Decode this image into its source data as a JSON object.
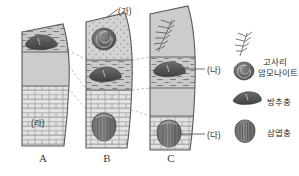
{
  "figure": {
    "kind": "geologic-columns-correlation",
    "background": "#ffffff",
    "ink": "#4a4a4a"
  },
  "columns": [
    {
      "id": "A",
      "letter": "A",
      "layers": [
        {
          "name": "shale-upper",
          "pattern": "shale-dashes",
          "fill": "#c9c9c9"
        },
        {
          "name": "mudstone-middle",
          "pattern": "plain",
          "fill": "#cccccc"
        },
        {
          "name": "limestone-lower",
          "pattern": "brick",
          "fill": "#e2e2e2"
        }
      ],
      "fossils": [
        "fusulinid"
      ],
      "label": "(라)"
    },
    {
      "id": "B",
      "letter": "B",
      "layers": [
        {
          "name": "sandstone-upper",
          "pattern": "dots",
          "fill": "#d2d2d2"
        },
        {
          "name": "shale-middle",
          "pattern": "shale-dashes",
          "fill": "#c9c9c9"
        },
        {
          "name": "limestone-lower",
          "pattern": "brick",
          "fill": "#e2e2e2"
        }
      ],
      "fossils": [
        "ammonite",
        "fusulinid",
        "trilobite"
      ],
      "label": "(가)"
    },
    {
      "id": "C",
      "letter": "C",
      "layers": [
        {
          "name": "mudstone-top",
          "pattern": "plain",
          "fill": "#cccccc"
        },
        {
          "name": "shale-upper",
          "pattern": "shale-dashes",
          "fill": "#c9c9c9"
        },
        {
          "name": "mudstone-middle",
          "pattern": "plain",
          "fill": "#cccccc"
        },
        {
          "name": "limestone-lower",
          "pattern": "brick",
          "fill": "#e2e2e2"
        }
      ],
      "fossils": [
        "fern",
        "fusulinid",
        "trilobite"
      ],
      "labels": [
        "(나)",
        "(다)"
      ]
    }
  ],
  "annotations": {
    "ga": "(가)",
    "na": "(나)",
    "da": "(다)",
    "ra": "(라)"
  },
  "letters": {
    "a": "A",
    "b": "B",
    "c": "C"
  },
  "legend": {
    "items": [
      {
        "icon": "fern-icon",
        "label": "고사리"
      },
      {
        "icon": "ammonite-icon",
        "label": "암모나이트"
      },
      {
        "icon": "fusulinid-icon",
        "label": "방추충"
      },
      {
        "icon": "trilobite-icon",
        "label": "삼엽충"
      }
    ]
  },
  "colors": {
    "outline": "#555555",
    "shale_fill": "#c9c9c9",
    "plain_fill": "#cccccc",
    "brick_fill": "#e3e3e3",
    "dots_fill": "#d3d3d3",
    "fossil_dark": "#5a5a5a",
    "fossil_mid": "#7c7c7c",
    "correlation_line": "#9a9a9a"
  }
}
